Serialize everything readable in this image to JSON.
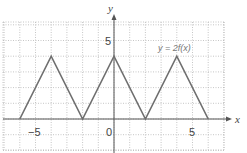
{
  "chart_data": {
    "type": "line",
    "title": "",
    "xlabel": "x",
    "ylabel": "y",
    "xlim": [
      -7,
      7
    ],
    "ylim": [
      -2,
      6
    ],
    "grid": true,
    "x_ticks_labeled": [
      -5,
      0,
      5
    ],
    "y_ticks_labeled": [
      5
    ],
    "tick_labels": {
      "x_neg5": "−5",
      "x_0": "0",
      "x_5": "5",
      "y_5": "5"
    },
    "series": [
      {
        "name": "y = 2f(x)",
        "x": [
          -6,
          -4,
          -2,
          0,
          2,
          4,
          6
        ],
        "y": [
          0,
          4,
          0,
          4,
          0,
          4,
          0
        ]
      }
    ],
    "annotations": [
      {
        "text": "y = 2f(x)",
        "x": 4,
        "y": 4.6
      }
    ],
    "color": "#6e6e6e"
  },
  "labels": {
    "x_axis": "x",
    "y_axis": "y",
    "curve_label": "y = 2f(x)",
    "tick_neg5": "−5",
    "tick_0": "0",
    "tick_5_x": "5",
    "tick_5_y": "5"
  }
}
